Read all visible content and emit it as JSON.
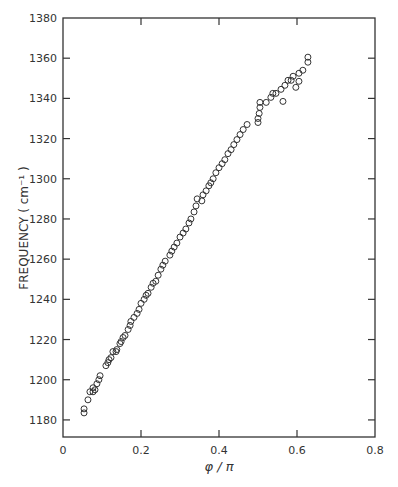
{
  "chart_data": {
    "type": "scatter",
    "title": "",
    "xlabel": "φ / π",
    "ylabel": "FREQUENCY  ( cm⁻¹ )",
    "xlim": [
      0,
      0.8
    ],
    "ylim": [
      1171.5,
      1380
    ],
    "x_ticks": [
      0,
      0.2,
      0.4,
      0.6,
      0.8
    ],
    "x_tick_labels": [
      "0",
      "0.2",
      "0.4",
      "0.6",
      "0.8"
    ],
    "y_ticks": [
      1180,
      1200,
      1220,
      1240,
      1260,
      1280,
      1300,
      1320,
      1340,
      1360,
      1380
    ],
    "y_tick_labels": [
      "1180",
      "1200",
      "1220",
      "1240",
      "1260",
      "1280",
      "1300",
      "1320",
      "1340",
      "1360",
      "1380"
    ],
    "grid": false,
    "legend": null,
    "marker": "open-circle",
    "colors": {
      "axis": "#333333",
      "marker": "#333333",
      "background": "#ffffff"
    },
    "series": [
      {
        "name": "frequency",
        "x": [
          0.054,
          0.054,
          0.064,
          0.069,
          0.077,
          0.082,
          0.077,
          0.087,
          0.092,
          0.095,
          0.11,
          0.115,
          0.118,
          0.123,
          0.128,
          0.136,
          0.138,
          0.146,
          0.149,
          0.154,
          0.159,
          0.167,
          0.172,
          0.174,
          0.182,
          0.19,
          0.195,
          0.2,
          0.208,
          0.213,
          0.218,
          0.226,
          0.231,
          0.238,
          0.244,
          0.251,
          0.256,
          0.262,
          0.274,
          0.279,
          0.285,
          0.292,
          0.3,
          0.308,
          0.315,
          0.323,
          0.328,
          0.336,
          0.341,
          0.344,
          0.356,
          0.359,
          0.367,
          0.374,
          0.379,
          0.385,
          0.392,
          0.4,
          0.408,
          0.415,
          0.423,
          0.431,
          0.438,
          0.446,
          0.454,
          0.462,
          0.472,
          0.5,
          0.5,
          0.503,
          0.505,
          0.505,
          0.521,
          0.533,
          0.538,
          0.546,
          0.559,
          0.564,
          0.569,
          0.577,
          0.585,
          0.59,
          0.597,
          0.605,
          0.615,
          0.628,
          0.628,
          0.605
        ],
        "y": [
          1183.5,
          1185.5,
          1190,
          1194,
          1194,
          1195,
          1196,
          1198,
          1200,
          1202,
          1207,
          1208.5,
          1210,
          1211,
          1214,
          1214,
          1215,
          1218,
          1219,
          1221,
          1222,
          1225,
          1227,
          1229,
          1231,
          1233,
          1235,
          1238,
          1240,
          1242,
          1243,
          1246,
          1248,
          1249,
          1252,
          1255,
          1257,
          1259,
          1262,
          1264,
          1266,
          1268,
          1271,
          1273,
          1275,
          1278,
          1280,
          1283.5,
          1286.5,
          1290,
          1289,
          1292,
          1294,
          1296.5,
          1298,
          1300,
          1303,
          1305.5,
          1307.5,
          1309.5,
          1312.5,
          1314.5,
          1317,
          1319.5,
          1322,
          1324.5,
          1327,
          1328,
          1330,
          1332.5,
          1335.5,
          1338,
          1338,
          1340.5,
          1342.5,
          1342.5,
          1344.5,
          1338.5,
          1346.5,
          1349,
          1349,
          1351,
          1345.5,
          1352.5,
          1354,
          1358,
          1360.5,
          1348.5
        ]
      }
    ]
  }
}
